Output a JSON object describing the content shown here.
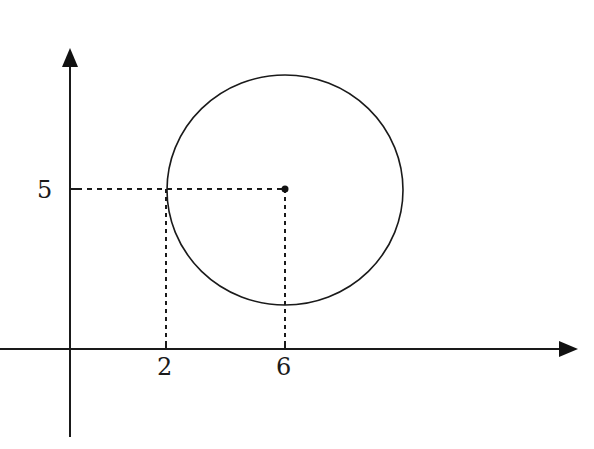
{
  "diagram": {
    "type": "circle-on-coordinate-plane",
    "axes": {
      "x_axis": {
        "arrow": "right",
        "ticks": [
          {
            "value": 2,
            "label": "2"
          },
          {
            "value": 6,
            "label": "6"
          }
        ]
      },
      "y_axis": {
        "arrow": "up",
        "ticks": [
          {
            "value": 5,
            "label": "5"
          }
        ]
      }
    },
    "circle": {
      "center": {
        "x": 6,
        "y": 5
      },
      "center_marked": true,
      "tangent_point_x": 2
    },
    "guides": {
      "style": "dashed",
      "from_center_to_y_axis": true,
      "from_center_to_x_axis": true,
      "from_leftmost_point_to_x_axis": true
    },
    "colors": {
      "stroke": "#1a1a1a",
      "background": "#ffffff"
    }
  }
}
